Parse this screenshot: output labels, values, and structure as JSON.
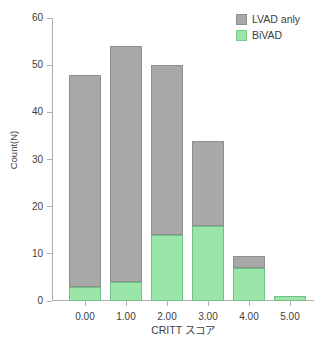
{
  "chart_data": {
    "type": "bar",
    "subtype": "stacked-bar-histogram",
    "title": "",
    "xlabel": "CRITT スコア",
    "ylabel": "Count(N)",
    "categories": [
      "0.00",
      "1.00",
      "2.00",
      "3.00",
      "4.00",
      "5.00"
    ],
    "series": [
      {
        "name": "BiVAD",
        "color": "#9ae5a8",
        "values": [
          3,
          4,
          14,
          16,
          7,
          1
        ]
      },
      {
        "name": "LVAD anly",
        "color": "#a8a8a8",
        "values": [
          45,
          50,
          36,
          18,
          2.5,
          0
        ]
      }
    ],
    "stack_totals": [
      48,
      54,
      50,
      34,
      9.5,
      1
    ],
    "ylim": [
      0,
      60
    ],
    "yticks": [
      0,
      10,
      20,
      30,
      40,
      50,
      60
    ],
    "ytick_labels": [
      "0",
      "10",
      "20",
      "30",
      "40",
      "50",
      "60"
    ],
    "xtick_labels": [
      "0.00",
      "1.00",
      "2.00",
      "3.00",
      "4.00",
      "5.00"
    ],
    "grid": false,
    "legend_position": "top-right",
    "legend_entries": [
      {
        "label": "LVAD anly",
        "color": "#a8a8a8",
        "swatch": "gray-square-swatch"
      },
      {
        "label": "BiVAD",
        "color": "#9ae5a8",
        "swatch": "green-square-swatch"
      }
    ],
    "stack_order": "BiVAD bottom, LVAD anly top",
    "axis_color": "#b0b0b0",
    "background": "#ffffff"
  },
  "legend": {
    "items": [
      {
        "label": "LVAD anly"
      },
      {
        "label": "BiVAD"
      }
    ]
  },
  "axes": {
    "y_title": "Count(N)",
    "x_title": "CRITT スコア",
    "y_ticks": [
      {
        "label": "60"
      },
      {
        "label": "50"
      },
      {
        "label": "40"
      },
      {
        "label": "30"
      },
      {
        "label": "20"
      },
      {
        "label": "10"
      },
      {
        "label": "0"
      }
    ],
    "x_ticks": [
      {
        "label": "0.00"
      },
      {
        "label": "1.00"
      },
      {
        "label": "2.00"
      },
      {
        "label": "3.00"
      },
      {
        "label": "4.00"
      },
      {
        "label": "5.00"
      }
    ]
  }
}
